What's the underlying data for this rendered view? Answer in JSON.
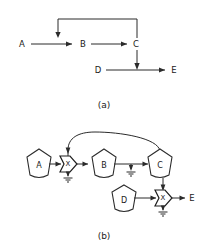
{
  "figure": {
    "background_color": "#ffffff",
    "line_color": "#2b2b2b",
    "text_color": "#1a1a1a",
    "panels": [
      {
        "id": "panel-a",
        "caption": "(a)",
        "type": "dataflow-graph",
        "nodes": [
          {
            "id": "a",
            "label": "A",
            "x": 22,
            "y": 44
          },
          {
            "id": "b",
            "label": "B",
            "x": 83,
            "y": 44
          },
          {
            "id": "c",
            "label": "C",
            "x": 136,
            "y": 44
          },
          {
            "id": "d",
            "label": "D",
            "x": 98,
            "y": 70
          },
          {
            "id": "e",
            "label": "E",
            "x": 174,
            "y": 70
          }
        ],
        "edges": [
          {
            "from": "A",
            "to": "B",
            "kind": "straight"
          },
          {
            "from": "B",
            "to": "C",
            "kind": "straight"
          },
          {
            "from": "C",
            "to": "B-input",
            "kind": "feedback-loop-top"
          },
          {
            "from": "C",
            "to": "D-E-line",
            "kind": "vertical-drop"
          },
          {
            "from": "D",
            "to": "E",
            "kind": "straight"
          }
        ]
      },
      {
        "id": "panel-b",
        "caption": "(b)",
        "type": "circuit-schematic",
        "nodes": [
          {
            "id": "a",
            "label": "A",
            "shape": "pentagon",
            "x": 39,
            "y": 164
          },
          {
            "id": "b",
            "label": "B",
            "shape": "pentagon",
            "x": 104,
            "y": 164
          },
          {
            "id": "c",
            "label": "C",
            "shape": "pentagon",
            "x": 160,
            "y": 164
          },
          {
            "id": "d",
            "label": "D",
            "shape": "pentagon",
            "x": 124,
            "y": 202
          },
          {
            "id": "e",
            "label": "E",
            "shape": "terminal-label",
            "x": 192,
            "y": 198
          }
        ],
        "gates": [
          {
            "id": "gate-1",
            "label": "X",
            "x": 68,
            "y": 164
          },
          {
            "id": "gate-2",
            "label": "X",
            "x": 163,
            "y": 198
          }
        ],
        "grounds": [
          {
            "id": "ground-1",
            "x": 68,
            "y": 178
          },
          {
            "id": "ground-2",
            "x": 131,
            "y": 172
          },
          {
            "id": "ground-3",
            "x": 163,
            "y": 212
          }
        ],
        "edges": [
          {
            "from": "A",
            "to": "gate-1",
            "kind": "straight"
          },
          {
            "from": "gate-1",
            "to": "B",
            "kind": "straight"
          },
          {
            "from": "B",
            "to": "C",
            "kind": "straight"
          },
          {
            "from": "C",
            "to": "gate-1",
            "kind": "feedback-arc"
          },
          {
            "from": "C",
            "to": "gate-2",
            "kind": "vertical-drop"
          },
          {
            "from": "D",
            "to": "gate-2",
            "kind": "straight"
          },
          {
            "from": "gate-2",
            "to": "E",
            "kind": "straight"
          }
        ]
      }
    ]
  }
}
